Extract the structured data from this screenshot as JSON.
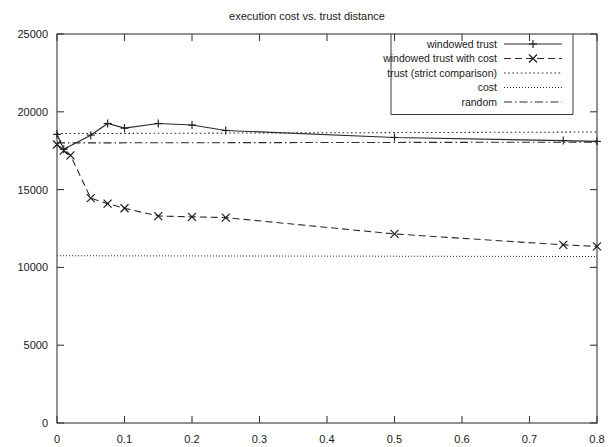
{
  "chart_data": {
    "type": "line",
    "title": "execution cost vs. trust distance",
    "xlabel": "",
    "ylabel": "",
    "xlim": [
      0,
      0.8
    ],
    "ylim": [
      0,
      25000
    ],
    "xticks": [
      "0",
      "0.1",
      "0.2",
      "0.3",
      "0.4",
      "0.5",
      "0.6",
      "0.7",
      "0.8"
    ],
    "xtick_values": [
      0,
      0.1,
      0.2,
      0.3,
      0.4,
      0.5,
      0.6,
      0.7,
      0.8
    ],
    "yticks": [
      "0",
      "5000",
      "10000",
      "15000",
      "20000",
      "25000"
    ],
    "ytick_values": [
      0,
      5000,
      10000,
      15000,
      20000,
      25000
    ],
    "grid": false,
    "legend_position": "top-right",
    "series": [
      {
        "name": "windowed trust",
        "style": "solid",
        "marker": "plus",
        "x": [
          0.0,
          0.01,
          0.05,
          0.075,
          0.1,
          0.15,
          0.2,
          0.25,
          0.5,
          0.75,
          0.8
        ],
        "y": [
          18550,
          17600,
          18500,
          19250,
          18950,
          19250,
          19150,
          18800,
          18350,
          18150,
          18100
        ]
      },
      {
        "name": "windowed trust with cost",
        "style": "dashed",
        "marker": "cross",
        "x": [
          0.0,
          0.01,
          0.02,
          0.05,
          0.075,
          0.1,
          0.15,
          0.2,
          0.25,
          0.5,
          0.75,
          0.8
        ],
        "y": [
          17900,
          17500,
          17200,
          14450,
          14100,
          13800,
          13300,
          13250,
          13200,
          12150,
          11450,
          11350
        ]
      },
      {
        "name": "trust (strict comparison)",
        "style": "dotted",
        "marker": "none",
        "x": [
          0.0,
          0.8
        ],
        "y": [
          18600,
          18700
        ]
      },
      {
        "name": "cost",
        "style": "fine-dotted",
        "marker": "none",
        "x": [
          0.0,
          0.8
        ],
        "y": [
          10750,
          10700
        ]
      },
      {
        "name": "random",
        "style": "dash-dot",
        "marker": "none",
        "x": [
          0.0,
          0.8
        ],
        "y": [
          18000,
          18050
        ]
      }
    ]
  },
  "legend": {
    "items": [
      {
        "label": "windowed trust",
        "style": "solid",
        "marker": "plus"
      },
      {
        "label": "windowed trust with cost",
        "style": "dashed",
        "marker": "cross"
      },
      {
        "label": "trust (strict comparison)",
        "style": "dotted",
        "marker": "none"
      },
      {
        "label": "cost",
        "style": "fine-dotted",
        "marker": "none"
      },
      {
        "label": "random",
        "style": "dash-dot",
        "marker": "none"
      }
    ]
  },
  "colors": {
    "line": "#2b2b2b",
    "axis": "#3a3a3a",
    "text": "#1a1a1a",
    "background": "#ffffff"
  }
}
